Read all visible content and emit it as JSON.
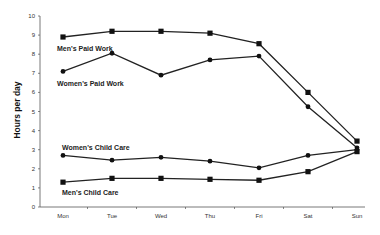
{
  "chart_data": {
    "type": "line",
    "title": "",
    "xlabel": "",
    "ylabel": "Hours per day",
    "ylim": [
      0,
      10
    ],
    "yticks": [
      "0",
      "1",
      "2",
      "3",
      "4",
      "5",
      "6",
      "7",
      "8",
      "9",
      "10"
    ],
    "categories": [
      "Mon",
      "Tue",
      "Wed",
      "Thu",
      "Fri",
      "Sat",
      "Sun"
    ],
    "grid": false,
    "legend": "inline labels",
    "series": [
      {
        "name": "Men's Paid Work",
        "marker": "square",
        "values": [
          8.9,
          9.2,
          9.2,
          9.1,
          8.55,
          6.0,
          3.45
        ]
      },
      {
        "name": "Women's Paid Work",
        "marker": "circle",
        "values": [
          7.1,
          8.05,
          6.9,
          7.7,
          7.9,
          5.25,
          3.1
        ]
      },
      {
        "name": "Women's Child Care",
        "marker": "circle",
        "values": [
          2.7,
          2.45,
          2.6,
          2.4,
          2.05,
          2.7,
          3.0
        ]
      },
      {
        "name": "Men's Child Care",
        "marker": "square",
        "values": [
          1.3,
          1.5,
          1.5,
          1.45,
          1.4,
          1.85,
          2.9
        ]
      }
    ]
  }
}
